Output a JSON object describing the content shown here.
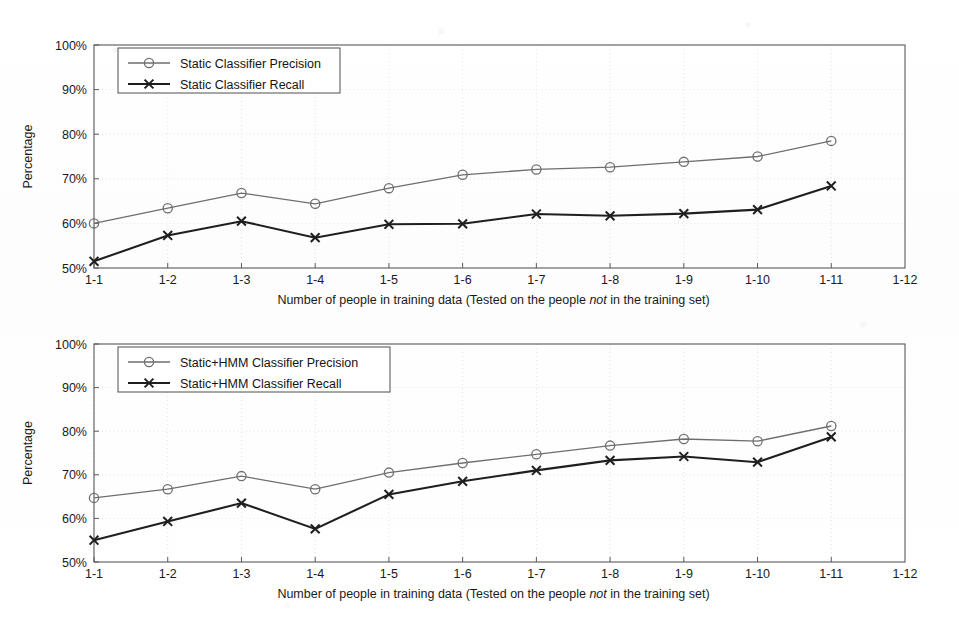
{
  "figure": {
    "background": "#ffffff",
    "precision_color": "#6e6e6e",
    "recall_color": "#1f1f1f"
  },
  "chart_data": [
    {
      "type": "line",
      "id": "static-classifier",
      "title": "",
      "xlabel_prefix": "Number of people in training data (Tested on the people ",
      "xlabel_italic": "not",
      "xlabel_suffix": " in the training set)",
      "ylabel": "Percentage",
      "categories": [
        "1-1",
        "1-2",
        "1-3",
        "1-4",
        "1-5",
        "1-6",
        "1-7",
        "1-8",
        "1-9",
        "1-10",
        "1-11",
        "1-12"
      ],
      "ytick_labels": [
        "50%",
        "60%",
        "70%",
        "80%",
        "90%",
        "100%"
      ],
      "yticks": [
        50,
        60,
        70,
        80,
        90,
        100
      ],
      "ylim": [
        50,
        100
      ],
      "grid": true,
      "legend_position": "top-left",
      "series": [
        {
          "name": "Static Classifier Precision",
          "marker": "circle",
          "values": [
            60.0,
            63.4,
            66.8,
            64.4,
            67.9,
            70.9,
            72.1,
            72.6,
            73.8,
            75.0,
            78.5
          ]
        },
        {
          "name": "Static Classifier Recall",
          "marker": "cross",
          "values": [
            51.5,
            57.3,
            60.5,
            56.8,
            59.8,
            59.9,
            62.1,
            61.7,
            62.2,
            63.1,
            68.4
          ]
        }
      ]
    },
    {
      "type": "line",
      "id": "static-hmm-classifier",
      "title": "",
      "xlabel_prefix": "Number of people in training data (Tested on the people ",
      "xlabel_italic": "not",
      "xlabel_suffix": " in the training set)",
      "ylabel": "Percentage",
      "categories": [
        "1-1",
        "1-2",
        "1-3",
        "1-4",
        "1-5",
        "1-6",
        "1-7",
        "1-8",
        "1-9",
        "1-10",
        "1-11",
        "1-12"
      ],
      "ytick_labels": [
        "50%",
        "60%",
        "70%",
        "80%",
        "90%",
        "100%"
      ],
      "yticks": [
        50,
        60,
        70,
        80,
        90,
        100
      ],
      "ylim": [
        50,
        100
      ],
      "grid": true,
      "legend_position": "top-left",
      "series": [
        {
          "name": "Static+HMM Classifier Precision",
          "marker": "circle",
          "values": [
            64.7,
            66.7,
            69.7,
            66.7,
            70.5,
            72.7,
            74.7,
            76.7,
            78.2,
            77.7,
            81.2
          ]
        },
        {
          "name": "Static+HMM Classifier Recall",
          "marker": "cross",
          "values": [
            55.0,
            59.3,
            63.5,
            57.6,
            65.5,
            68.5,
            71.0,
            73.3,
            74.2,
            72.9,
            78.7
          ]
        }
      ]
    }
  ]
}
